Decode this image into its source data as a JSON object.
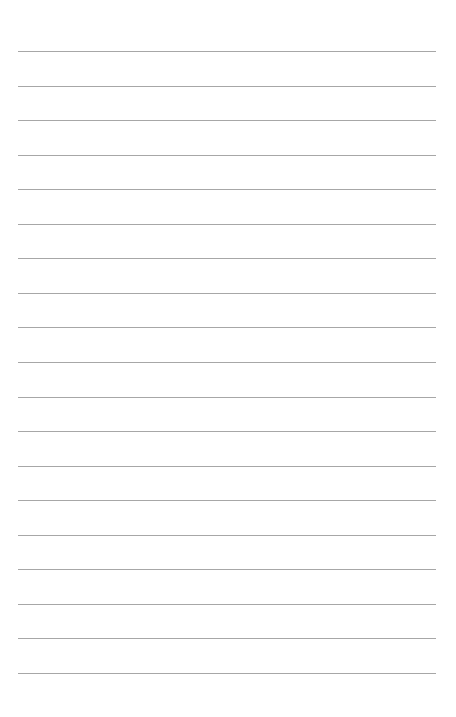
{
  "page": {
    "type": "lined-paper",
    "background_color": "#ffffff",
    "line_color": "#8a8a8a",
    "line_count": 19,
    "first_line_y": 51,
    "line_spacing": 34.55,
    "line_left": 18,
    "line_right": 436,
    "text": ""
  }
}
